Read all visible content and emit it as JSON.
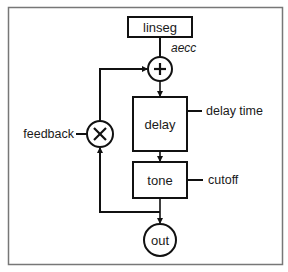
{
  "diagram": {
    "nodes": {
      "linseg": "linseg",
      "delay": "delay",
      "tone": "tone",
      "out": "out",
      "adder_symbol": "+",
      "multiplier_symbol": "×"
    },
    "labels": {
      "aecc": "aecc",
      "delay_time": "delay time",
      "cutoff": "cutoff",
      "feedback": "feedback"
    },
    "colors": {
      "stroke": "#111111",
      "frame": "#777777",
      "background": "#ffffff"
    }
  }
}
